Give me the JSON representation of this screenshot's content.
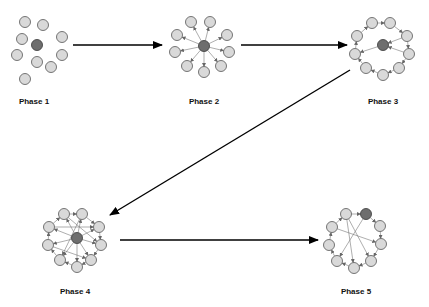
{
  "diagram": {
    "phases": [
      {
        "id": "phase1",
        "label": "Phase 1",
        "structure": "scattered",
        "nodes": 10,
        "hub_index": 4,
        "edges": []
      },
      {
        "id": "phase2",
        "label": "Phase 2",
        "structure": "star (hub links to all)",
        "nodes": 10,
        "hub_index": 0,
        "edges_type": "hub-spoke"
      },
      {
        "id": "phase3",
        "label": "Phase 3",
        "structure": "ring with few hub links",
        "nodes": 10,
        "hub_index": 0,
        "edges_type": "ring"
      },
      {
        "id": "phase4",
        "label": "Phase 4",
        "structure": "ring + hub spokes + chords",
        "nodes": 10,
        "hub_index": 0,
        "edges_type": "dense"
      },
      {
        "id": "phase5",
        "label": "Phase 5",
        "structure": "ring with cross chords, hub on ring",
        "nodes": 9,
        "hub_index": 0,
        "edges_type": "ring-chords"
      }
    ],
    "flow": [
      {
        "from": "phase1",
        "to": "phase2"
      },
      {
        "from": "phase2",
        "to": "phase3"
      },
      {
        "from": "phase3",
        "to": "phase4"
      },
      {
        "from": "phase4",
        "to": "phase5"
      }
    ],
    "colors": {
      "node_fill": "#d9d9d9",
      "hub_fill": "#6e6e6e",
      "arrow": "#000000"
    }
  }
}
